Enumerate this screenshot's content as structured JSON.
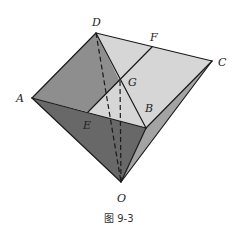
{
  "figure": {
    "caption": "图 9-3",
    "labels": {
      "A": "A",
      "B": "B",
      "C": "C",
      "D": "D",
      "E": "E",
      "F": "F",
      "G": "G",
      "O": "O"
    },
    "colors": {
      "face_top_left": "#8e8e8e",
      "face_top_light": "#d6d6d6",
      "face_front": "#686868",
      "face_right": "#a3a3a3",
      "edge": "#1a1a1a"
    }
  }
}
